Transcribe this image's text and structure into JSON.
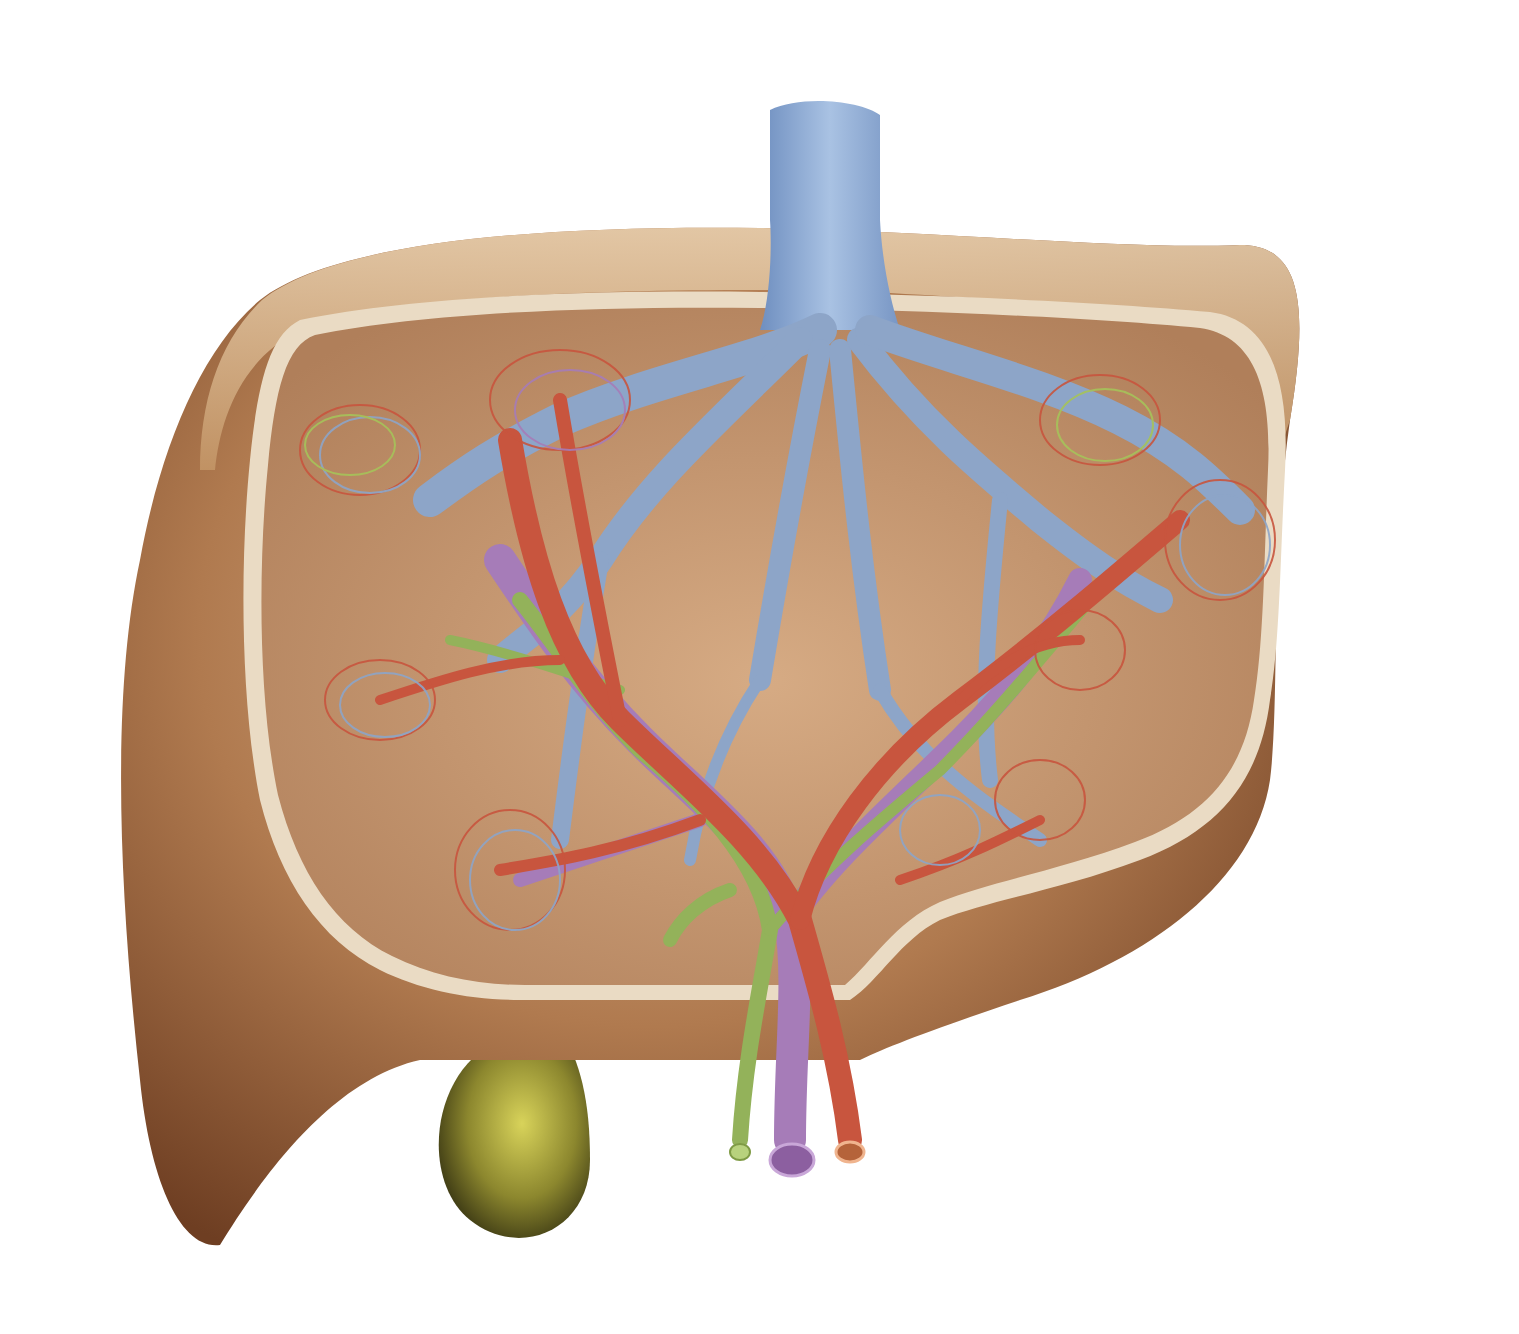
{
  "illustration": {
    "subject": "Liver cross-section anatomical illustration",
    "structures": [
      {
        "name": "liver",
        "color": "#b07a4f"
      },
      {
        "name": "hepatic-vein",
        "color": "#8fa7c9"
      },
      {
        "name": "inferior-vena-cava",
        "color": "#7f9cc8"
      },
      {
        "name": "hepatic-artery",
        "color": "#c9553f"
      },
      {
        "name": "portal-vein",
        "color": "#a77db8"
      },
      {
        "name": "bile-duct",
        "color": "#8fae55"
      },
      {
        "name": "gallbladder",
        "color": "#a7a03a"
      }
    ]
  },
  "colors": {
    "background": "#ffffff",
    "liver_outer": "#a8714a",
    "liver_rim": "#d7b48c",
    "liver_cut_edge": "#eadbc4",
    "liver_inner": "#c99a74",
    "vein": "#8da5c8",
    "artery": "#c8553e",
    "portal": "#a67cb8",
    "bile": "#93b25a",
    "gallbladder": "#9c9636"
  }
}
